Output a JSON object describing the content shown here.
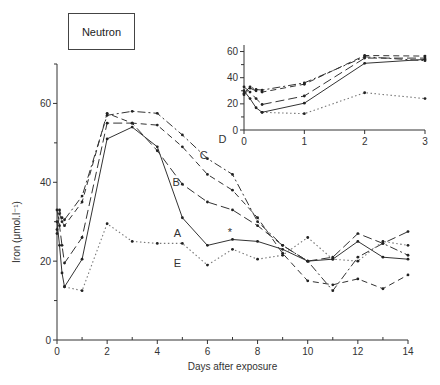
{
  "legend_box": {
    "label": "Neutron"
  },
  "chart_data": [
    {
      "type": "line",
      "title": "Neutron",
      "xlabel": "Days after exposure",
      "ylabel": "Iron (μmol.l⁻¹)",
      "xlim": [
        0,
        14
      ],
      "ylim": [
        0,
        70
      ],
      "x_ticks": [
        0,
        2,
        4,
        6,
        8,
        10,
        12,
        14
      ],
      "y_ticks": [
        0,
        20,
        40,
        60
      ],
      "grid": false,
      "series": [
        {
          "name": "A",
          "style": "solid",
          "x": [
            0,
            0.1,
            0.2,
            0.3,
            1,
            2,
            3,
            4,
            5,
            6,
            7,
            8,
            9,
            10,
            11,
            12,
            13,
            14
          ],
          "y": [
            30,
            24,
            17,
            13.5,
            20.5,
            51,
            54,
            49,
            31,
            24,
            25.5,
            25,
            23,
            20,
            20.5,
            25,
            21,
            20.5
          ]
        },
        {
          "name": "B",
          "style": "long-dash",
          "x": [
            0,
            0.1,
            0.2,
            0.3,
            1,
            2,
            3,
            4,
            5,
            6,
            7,
            8,
            9,
            10,
            11,
            12,
            13,
            14
          ],
          "y": [
            33,
            29,
            24,
            19.5,
            26,
            55,
            55,
            48,
            39.5,
            35,
            33,
            29,
            24,
            20,
            21,
            27,
            24.5,
            27.5
          ]
        },
        {
          "name": "C",
          "style": "dash",
          "x": [
            0,
            0.1,
            0.2,
            0.3,
            1,
            2,
            3,
            4,
            5,
            6,
            7,
            8,
            9,
            10,
            11,
            12,
            13,
            14
          ],
          "y": [
            27,
            32,
            30,
            29,
            35,
            57.5,
            55,
            54.5,
            49,
            42,
            38,
            31,
            22,
            15,
            14,
            15.5,
            13,
            16.5
          ]
        },
        {
          "name": "D",
          "style": "dash-dot",
          "x": [
            0,
            0.1,
            0.2,
            0.3,
            1,
            2,
            3,
            4,
            5,
            6,
            7,
            8,
            9,
            10,
            11,
            12,
            13,
            14
          ],
          "y": [
            28,
            33,
            31,
            30.5,
            36.5,
            57,
            58,
            57.5,
            52,
            46,
            42,
            30,
            24,
            20,
            12.5,
            21,
            24.5,
            21.5
          ]
        },
        {
          "name": "E",
          "style": "dotted",
          "x": [
            0.3,
            1,
            2,
            3,
            4,
            5,
            6,
            7,
            8,
            9,
            10,
            11,
            12,
            13,
            14
          ],
          "y": [
            13.5,
            12.5,
            29.5,
            25,
            24.5,
            24.5,
            19,
            23,
            20.5,
            21.5,
            26,
            20.5,
            20,
            25,
            24
          ]
        }
      ],
      "annotations": [
        {
          "text": "*",
          "x": 6.9,
          "y": 27.5
        }
      ]
    },
    {
      "type": "line",
      "title": "Inset: days 0-3",
      "xlim": [
        0,
        3
      ],
      "ylim": [
        0,
        65
      ],
      "x_ticks": [
        0,
        1,
        2,
        3
      ],
      "y_ticks": [
        0,
        20,
        40,
        60
      ],
      "grid": false,
      "series": [
        {
          "name": "A",
          "style": "solid",
          "x": [
            0,
            0.1,
            0.2,
            0.3,
            1,
            2,
            3
          ],
          "y": [
            30,
            24,
            17,
            13.5,
            20.5,
            51,
            54
          ]
        },
        {
          "name": "B",
          "style": "long-dash",
          "x": [
            0,
            0.1,
            0.2,
            0.3,
            1,
            2,
            3
          ],
          "y": [
            33,
            29,
            24,
            19.5,
            26,
            55,
            55
          ]
        },
        {
          "name": "C",
          "style": "dash",
          "x": [
            0,
            0.1,
            0.2,
            0.3,
            1,
            2,
            3
          ],
          "y": [
            27,
            32,
            30,
            29,
            35,
            57,
            56.5
          ]
        },
        {
          "name": "D",
          "style": "dash-dot",
          "x": [
            0,
            0.1,
            0.2,
            0.3,
            1,
            2,
            3
          ],
          "y": [
            28,
            33,
            31,
            30.5,
            36,
            56,
            53
          ]
        },
        {
          "name": "E",
          "style": "dotted",
          "x": [
            0.3,
            1,
            2,
            3
          ],
          "y": [
            13.5,
            12.5,
            28.5,
            24
          ]
        }
      ]
    }
  ]
}
